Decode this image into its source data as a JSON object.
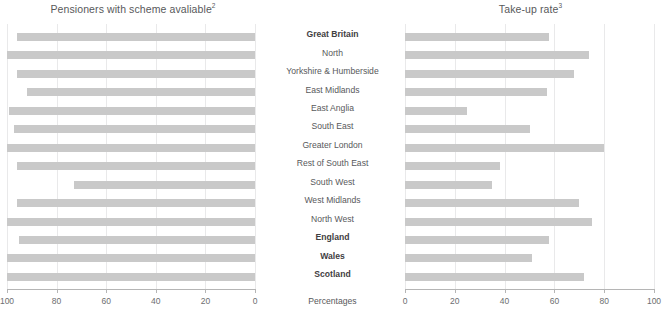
{
  "chart_data": [
    {
      "type": "bar",
      "orientation": "horizontal",
      "title": "Pensioners with scheme avaliable",
      "title_superscript": "2",
      "xlabel": "Percentages",
      "ylabel": "",
      "xlim": [
        100,
        0
      ],
      "reversed_axis": true,
      "grid": true,
      "ticks": [
        100,
        80,
        60,
        40,
        20,
        0
      ],
      "categories": [
        "Great Britain",
        "North",
        "Yorkshire & Humberside",
        "East Midlands",
        "East Anglia",
        "South East",
        "Greater London",
        "Rest of South East",
        "South West",
        "West Midlands",
        "North West",
        "England",
        "Wales",
        "Scotland"
      ],
      "values": [
        96,
        100,
        96,
        92,
        99,
        97,
        100,
        96,
        73,
        96,
        100,
        95,
        100,
        100
      ],
      "bar_color": "#c9c9c9"
    },
    {
      "type": "bar",
      "orientation": "horizontal",
      "title": "Take-up rate",
      "title_superscript": "3",
      "xlabel": "Percentages",
      "ylabel": "",
      "xlim": [
        0,
        100
      ],
      "reversed_axis": false,
      "grid": true,
      "ticks": [
        0,
        20,
        40,
        60,
        80,
        100
      ],
      "categories": [
        "Great Britain",
        "North",
        "Yorkshire & Humberside",
        "East Midlands",
        "East Anglia",
        "South East",
        "Greater London",
        "Rest of South East",
        "South West",
        "West Midlands",
        "North West",
        "England",
        "Wales",
        "Scotland"
      ],
      "values": [
        58,
        74,
        68,
        57,
        25,
        50,
        80,
        38,
        35,
        70,
        75,
        58,
        51,
        72
      ],
      "bar_color": "#c9c9c9"
    }
  ],
  "left": {
    "title": "Pensioners with scheme avaliable",
    "title_sup": "2",
    "tick_labels": [
      "100",
      "80",
      "60",
      "40",
      "20",
      "0"
    ]
  },
  "right": {
    "title": "Take-up rate",
    "title_sup": "3",
    "tick_labels": [
      "0",
      "20",
      "40",
      "60",
      "80",
      "100"
    ]
  },
  "center": {
    "categories": [
      {
        "label": "Great Britain",
        "bold": true
      },
      {
        "label": "North",
        "bold": false
      },
      {
        "label": "Yorkshire & Humberside",
        "bold": false
      },
      {
        "label": "East Midlands",
        "bold": false
      },
      {
        "label": "East Anglia",
        "bold": false
      },
      {
        "label": "South East",
        "bold": false
      },
      {
        "label": "Greater London",
        "bold": false
      },
      {
        "label": "Rest of South East",
        "bold": false
      },
      {
        "label": "South West",
        "bold": false
      },
      {
        "label": "West Midlands",
        "bold": false
      },
      {
        "label": "North West",
        "bold": false
      },
      {
        "label": "England",
        "bold": true
      },
      {
        "label": "Wales",
        "bold": true
      },
      {
        "label": "Scotland",
        "bold": true
      }
    ],
    "axis_caption": "Percentages"
  }
}
